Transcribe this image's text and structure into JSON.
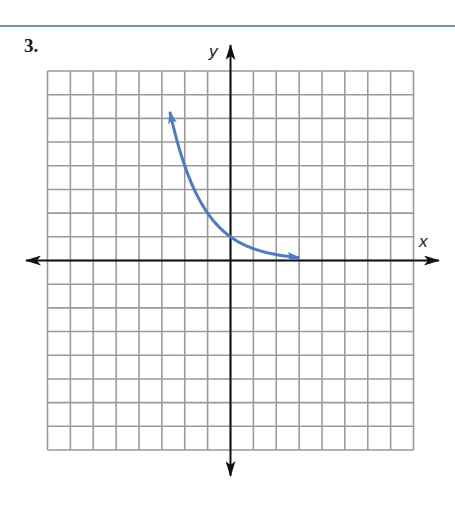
{
  "problem": {
    "number": "3."
  },
  "axes": {
    "x_label": "x",
    "y_label": "y"
  },
  "colors": {
    "rule": "#6f8fd2",
    "curve": "#4a7cc7",
    "grid": "#9a9a9a",
    "axis": "#111111"
  },
  "chart_data": {
    "type": "line",
    "title": "",
    "xlabel": "x",
    "ylabel": "y",
    "grid": true,
    "xlim": [
      -8,
      8
    ],
    "ylim": [
      -8,
      8
    ],
    "grid_step": 1,
    "tick_labels": "none",
    "series": [
      {
        "name": "y = (1/2)^x",
        "function": "y = (1/2)^x",
        "arrows": "both ends",
        "x": [
          -2.7,
          -2,
          -1,
          0,
          1,
          2,
          3
        ],
        "y": [
          6.5,
          4,
          2,
          1,
          0.5,
          0.25,
          0.125
        ]
      }
    ]
  }
}
